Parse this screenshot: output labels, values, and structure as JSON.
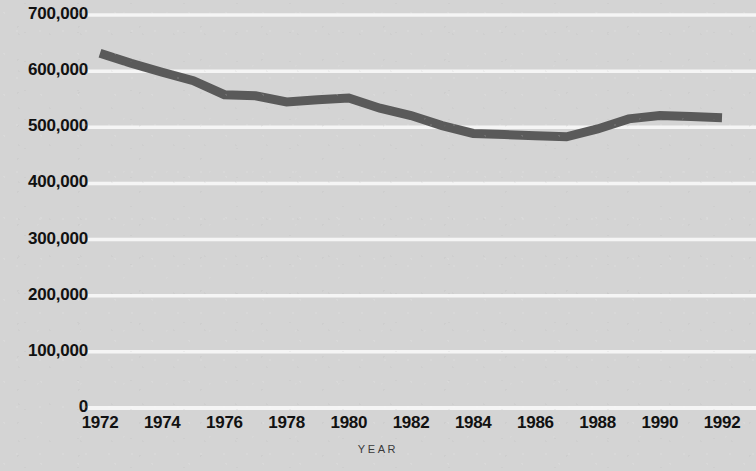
{
  "chart_data": {
    "type": "line",
    "title": "",
    "subtitle": "",
    "xlabel": "YEAR",
    "ylabel": "",
    "grid": true,
    "legend": "none",
    "xlim": [
      1972,
      1992
    ],
    "ylim": [
      0,
      700000
    ],
    "y_ticks": [
      0,
      100000,
      200000,
      300000,
      400000,
      500000,
      600000,
      700000
    ],
    "y_tick_labels": [
      "0",
      "100,000",
      "200,000",
      "300,000",
      "400,000",
      "500,000",
      "600,000",
      "700,000"
    ],
    "x_ticks": [
      1972,
      1974,
      1976,
      1978,
      1980,
      1982,
      1984,
      1986,
      1988,
      1990,
      1992
    ],
    "x_tick_labels": [
      "1972",
      "1974",
      "1976",
      "1978",
      "1980",
      "1982",
      "1984",
      "1986",
      "1988",
      "1990",
      "1992"
    ],
    "series": [
      {
        "name": "",
        "color": "#5a5a5a",
        "line_width": 9,
        "x": [
          1972,
          1973,
          1974,
          1975,
          1976,
          1977,
          1978,
          1979,
          1980,
          1981,
          1982,
          1983,
          1984,
          1985,
          1986,
          1987,
          1988,
          1989,
          1990,
          1991,
          1992
        ],
        "values": [
          632000,
          614000,
          598000,
          583000,
          558000,
          556000,
          545000,
          549000,
          552000,
          534000,
          521000,
          503000,
          489000,
          487000,
          485000,
          483000,
          497000,
          515000,
          521000,
          519000,
          517000
        ]
      }
    ]
  },
  "colors": {
    "background": "#d4d4d4",
    "gridline": "#f5f5f5",
    "line": "#5a5a5a",
    "tick_text": "#111111",
    "axis_title_text": "#3a3a3a"
  }
}
